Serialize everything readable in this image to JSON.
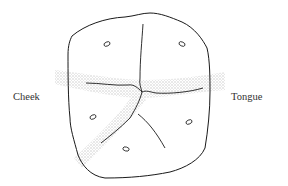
{
  "diagram": {
    "type": "tooth occlusal surface sketch",
    "labels": {
      "left": "Cheek",
      "right": "Tongue"
    },
    "colors": {
      "outline": "#1a1a1a",
      "shaded_band": "#c8c8c8"
    },
    "features": {
      "cusps_marks": 6,
      "shaded_bands": [
        "horizontal band across middle",
        "diagonal band toward lower-left"
      ]
    }
  }
}
